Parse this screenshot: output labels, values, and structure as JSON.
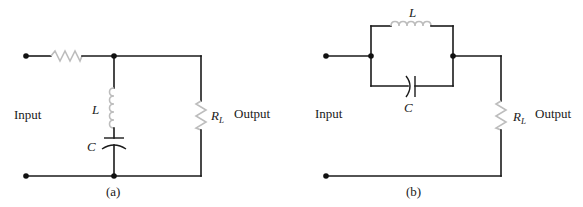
{
  "figure_a": {
    "caption": "(a)",
    "input_label": "Input",
    "output_label": "Output",
    "inductor_label": "L",
    "capacitor_label": "C",
    "load_label_main": "R",
    "load_label_sub": "L",
    "topology": "series resistor; series LC branch shunted across output; load resistor RL"
  },
  "figure_b": {
    "caption": "(b)",
    "input_label": "Input",
    "output_label": "Output",
    "inductor_label": "L",
    "capacitor_label": "C",
    "load_label_main": "R",
    "load_label_sub": "L",
    "topology": "parallel LC tank in series between input and load resistor RL"
  },
  "colors": {
    "wire": "#1a1a1a",
    "component": "#bdbdbd",
    "background": "#ffffff"
  }
}
